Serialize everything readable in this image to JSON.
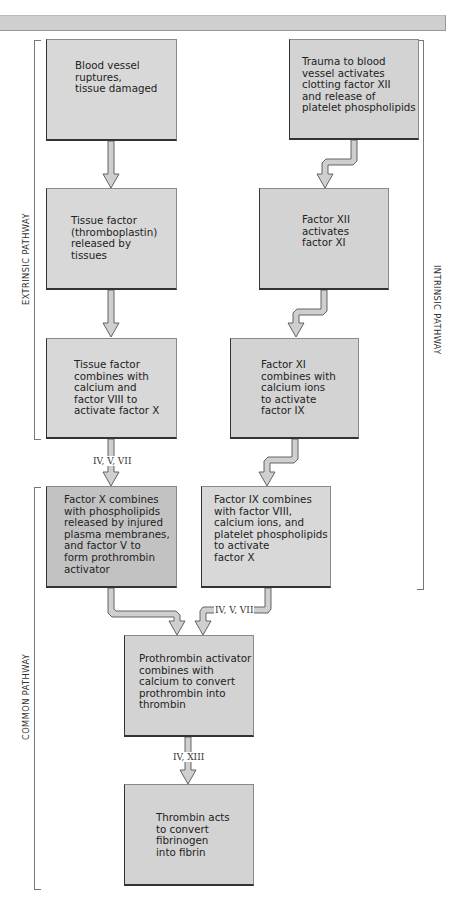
{
  "header": {
    "band": ""
  },
  "pathways": {
    "extrinsic": "EXTRINSIC PATHWAY",
    "intrinsic": "INTRINSIC PATHWAY",
    "common": "COMMON PATHWAY"
  },
  "steps": {
    "blood_vessel": "Blood vessel\nruptures,\ntissue damaged",
    "trauma": "Trauma to blood\nvessel activates\nclotting factor XII\nand release of\nplatelet phospholipids",
    "tissue_factor": "Tissue factor\n(thromboplastin)\nreleased by\ntissues",
    "factor_xii": "Factor XII\nactivates\nfactor XI",
    "tissue_combines": "Tissue factor\ncombines with\ncalcium and\nfactor VIII to\nactivate factor X",
    "factor_xi": "Factor XI\ncombines with\ncalcium ions\nto activate\nfactor IX",
    "factor_x": "Factor X combines\nwith phospholipids\nreleased by injured\nplasma membranes,\nand factor V to\nform prothrombin\nactivator",
    "factor_ix": "Factor IX combines\nwith factor VIII,\ncalcium ions, and\nplatelet phospholipids\nto activate\nfactor X",
    "prothrombin": "Prothrombin activator\ncombines with\ncalcium to convert\nprothrombin into\nthrombin",
    "thrombin": "Thrombin acts\nto convert\nfibrinogen\ninto fibrin"
  },
  "factor_labels": {
    "extrinsic_to_common": "IV, V, VII",
    "intrinsic_to_common": "IV, V, VII",
    "prothrombin_to_thrombin": "IV, XIII"
  },
  "colors": {
    "box_fill": "#d3d3d3",
    "box_dark_fill": "#c2c2c2",
    "band": "#cfcfcf",
    "arrow_fill": "#cfcfcf",
    "arrow_stroke": "#555555"
  }
}
